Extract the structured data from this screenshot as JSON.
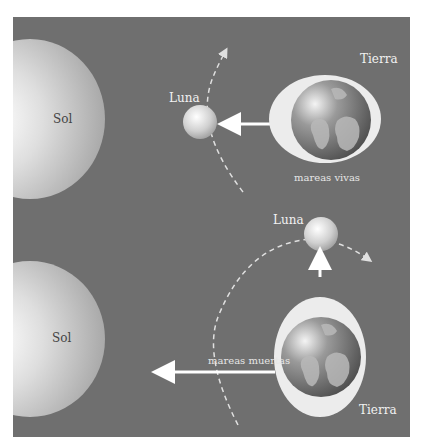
{
  "diagram": {
    "colors": {
      "background": "#6f6f6f",
      "sun": "#e8e8e8",
      "moon": "#dcdcdc",
      "ocean_bulge": "#ececec",
      "arrow": "#ffffff",
      "orbit": "#e0e0e0"
    },
    "top_scene": {
      "sun_label": "Sol",
      "moon_label": "Luna",
      "earth_label": "Tierra",
      "tide_label": "mareas vivas"
    },
    "bottom_scene": {
      "sun_label": "Sol",
      "moon_label": "Luna",
      "earth_label": "Tierra",
      "tide_label": "mareas muertas"
    }
  }
}
